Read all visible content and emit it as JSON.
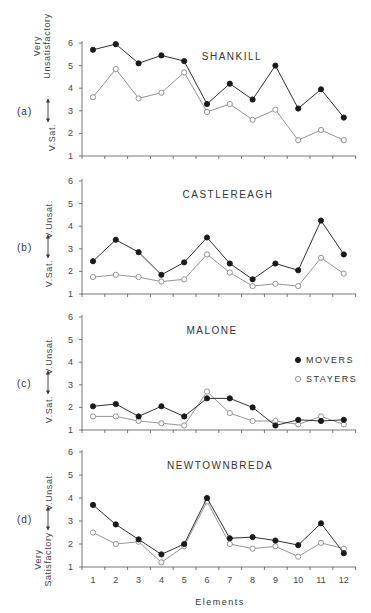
{
  "chart_data": [
    {
      "type": "line",
      "panel": "(a)",
      "title": "SHANKILL",
      "ylabel_top": "Very Unsatisfactory",
      "ylabel_bottom": "V.Sat.",
      "xlabel": "",
      "ylim": [
        1,
        6
      ],
      "yticks": [
        1,
        2,
        3,
        4,
        5,
        6
      ],
      "categories": [
        1,
        2,
        3,
        4,
        5,
        6,
        7,
        8,
        9,
        10,
        11,
        12
      ],
      "series": [
        {
          "name": "MOVERS",
          "marker": "filled-circle",
          "values": [
            5.7,
            5.95,
            5.1,
            5.45,
            5.2,
            3.3,
            4.2,
            3.5,
            5.0,
            3.1,
            3.95,
            2.7
          ]
        },
        {
          "name": "STAYERS",
          "marker": "open-circle",
          "values": [
            3.6,
            4.85,
            3.55,
            3.8,
            4.7,
            2.95,
            3.3,
            2.6,
            3.05,
            1.7,
            2.15,
            1.7
          ]
        }
      ]
    },
    {
      "type": "line",
      "panel": "(b)",
      "title": "CASTLEREAGH",
      "ylabel_top": "V.Unsat.",
      "ylabel_bottom": "V.Sat.",
      "xlabel": "",
      "ylim": [
        1,
        6
      ],
      "yticks": [
        1,
        2,
        3,
        4,
        5,
        6
      ],
      "categories": [
        1,
        2,
        3,
        4,
        5,
        6,
        7,
        8,
        9,
        10,
        11,
        12
      ],
      "series": [
        {
          "name": "MOVERS",
          "marker": "filled-circle",
          "values": [
            2.45,
            3.4,
            2.85,
            1.85,
            2.4,
            3.5,
            2.35,
            1.65,
            2.35,
            2.05,
            4.25,
            2.75
          ]
        },
        {
          "name": "STAYERS",
          "marker": "open-circle",
          "values": [
            1.75,
            1.85,
            1.75,
            1.55,
            1.65,
            2.75,
            1.95,
            1.35,
            1.45,
            1.35,
            2.6,
            1.9
          ]
        }
      ]
    },
    {
      "type": "line",
      "panel": "(c)",
      "title": "MALONE",
      "ylabel_top": "V.Unsat.",
      "ylabel_bottom": "V.Sat.",
      "xlabel": "",
      "ylim": [
        1,
        6
      ],
      "yticks": [
        1,
        2,
        3,
        4,
        5,
        6
      ],
      "categories": [
        1,
        2,
        3,
        4,
        5,
        6,
        7,
        8,
        9,
        10,
        11,
        12
      ],
      "legend": [
        {
          "label": "MOVERS",
          "marker": "filled-circle"
        },
        {
          "label": "STAYERS",
          "marker": "open-circle"
        }
      ],
      "series": [
        {
          "name": "MOVERS",
          "marker": "filled-circle",
          "values": [
            2.05,
            2.15,
            1.6,
            2.05,
            1.6,
            2.4,
            2.4,
            2.0,
            1.2,
            1.45,
            1.4,
            1.45
          ]
        },
        {
          "name": "STAYERS",
          "marker": "open-circle",
          "values": [
            1.6,
            1.6,
            1.4,
            1.3,
            1.2,
            2.7,
            1.75,
            1.4,
            1.4,
            1.25,
            1.6,
            1.25
          ]
        }
      ]
    },
    {
      "type": "line",
      "panel": "(d)",
      "title": "NEWTOWNBREDA",
      "ylabel_top": "V.Unsat.",
      "ylabel_bottom": "Very Satisfactory",
      "xlabel": "Elements",
      "ylim": [
        1,
        6
      ],
      "yticks": [
        1,
        2,
        3,
        4,
        5,
        6
      ],
      "categories": [
        1,
        2,
        3,
        4,
        5,
        6,
        7,
        8,
        9,
        10,
        11,
        12
      ],
      "series": [
        {
          "name": "MOVERS",
          "marker": "filled-circle",
          "values": [
            3.7,
            2.85,
            2.2,
            1.55,
            2.0,
            4.0,
            2.25,
            2.3,
            2.15,
            1.95,
            2.9,
            1.6
          ]
        },
        {
          "name": "STAYERS",
          "marker": "open-circle",
          "values": [
            2.5,
            2.0,
            2.1,
            1.2,
            1.9,
            3.85,
            2.0,
            1.8,
            1.9,
            1.45,
            2.05,
            1.8
          ]
        }
      ]
    }
  ],
  "layout": {
    "panels": [
      {
        "top": 43,
        "bottom": 156
      },
      {
        "top": 181,
        "bottom": 294
      },
      {
        "top": 317,
        "bottom": 430
      },
      {
        "top": 452,
        "bottom": 567
      }
    ],
    "x_left": 82,
    "x_right": 356,
    "x_first": 93,
    "x_step": 22.8,
    "colors": {
      "movers": "#1a1a1a",
      "stayers": "#888888",
      "axis": "#555555",
      "open_fill": "#ffffff"
    }
  }
}
